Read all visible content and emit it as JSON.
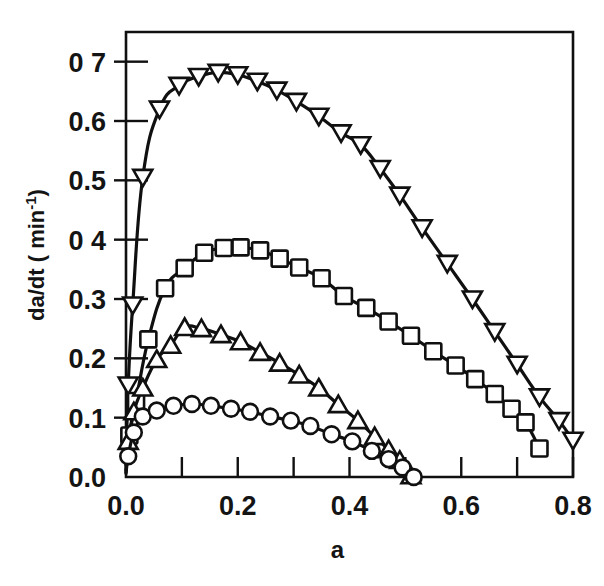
{
  "figure": {
    "background_color": "#ffffff",
    "ink_color": "#101010",
    "x_axis_label": "a",
    "y_axis_label": "da/dt ( min",
    "y_axis_label_sup": "-1",
    "y_axis_label_tail": ")"
  },
  "chart_data": {
    "type": "line",
    "title": "",
    "xlabel": "a",
    "ylabel": "da/dt ( min-1)",
    "xlim": [
      0.0,
      0.8
    ],
    "ylim": [
      0.0,
      0.75
    ],
    "grid": false,
    "legend": "none",
    "xticks": [
      0.0,
      0.1,
      0.2,
      0.3,
      0.4,
      0.5,
      0.6,
      0.7,
      0.8
    ],
    "xtick_labels": [
      "0.0",
      "",
      "0.2",
      "",
      "0.4",
      "",
      "0.6",
      "",
      "0.8"
    ],
    "yticks": [
      0.0,
      0.1,
      0.2,
      0.3,
      0.4,
      0.5,
      0.6,
      0.7
    ],
    "ytick_labels": [
      "0.0",
      "0.1",
      "0.2",
      "0.3",
      "0 4",
      "0.5",
      "0.6",
      "0 7"
    ],
    "series": [
      {
        "name": "series-triangle-down",
        "marker": "triangle-down",
        "x": [
          0.0,
          0.004,
          0.012,
          0.03,
          0.06,
          0.095,
          0.13,
          0.165,
          0.2,
          0.235,
          0.27,
          0.305,
          0.345,
          0.385,
          0.42,
          0.455,
          0.49,
          0.53,
          0.575,
          0.62,
          0.66,
          0.7,
          0.74,
          0.775,
          0.8
        ],
        "y": [
          0.02,
          0.155,
          0.29,
          0.505,
          0.62,
          0.66,
          0.675,
          0.682,
          0.678,
          0.667,
          0.652,
          0.633,
          0.608,
          0.58,
          0.56,
          0.52,
          0.475,
          0.42,
          0.36,
          0.3,
          0.245,
          0.19,
          0.135,
          0.095,
          0.062
        ]
      },
      {
        "name": "series-square",
        "marker": "square",
        "x": [
          0.0,
          0.006,
          0.018,
          0.04,
          0.07,
          0.105,
          0.14,
          0.175,
          0.205,
          0.24,
          0.275,
          0.31,
          0.35,
          0.39,
          0.43,
          0.47,
          0.51,
          0.55,
          0.59,
          0.625,
          0.66,
          0.69,
          0.715,
          0.74
        ],
        "y": [
          0.012,
          0.07,
          0.128,
          0.232,
          0.318,
          0.352,
          0.378,
          0.386,
          0.387,
          0.382,
          0.368,
          0.353,
          0.335,
          0.305,
          0.285,
          0.262,
          0.238,
          0.212,
          0.188,
          0.165,
          0.14,
          0.115,
          0.092,
          0.048
        ]
      },
      {
        "name": "series-triangle-up",
        "marker": "triangle-up",
        "x": [
          0.0,
          0.004,
          0.014,
          0.03,
          0.055,
          0.08,
          0.105,
          0.135,
          0.17,
          0.205,
          0.24,
          0.275,
          0.31,
          0.345,
          0.38,
          0.415,
          0.445,
          0.47,
          0.49,
          0.51
        ],
        "y": [
          0.008,
          0.06,
          0.11,
          0.15,
          0.198,
          0.222,
          0.252,
          0.25,
          0.24,
          0.228,
          0.21,
          0.192,
          0.172,
          0.15,
          0.122,
          0.095,
          0.068,
          0.046,
          0.028,
          0.002
        ]
      },
      {
        "name": "series-circle",
        "marker": "circle",
        "x": [
          0.0,
          0.004,
          0.014,
          0.03,
          0.055,
          0.085,
          0.118,
          0.152,
          0.188,
          0.222,
          0.258,
          0.295,
          0.33,
          0.368,
          0.405,
          0.44,
          0.47,
          0.495,
          0.515
        ],
        "y": [
          0.006,
          0.035,
          0.075,
          0.102,
          0.112,
          0.12,
          0.123,
          0.12,
          0.115,
          0.11,
          0.102,
          0.095,
          0.086,
          0.072,
          0.06,
          0.044,
          0.03,
          0.016,
          0.0
        ]
      }
    ]
  }
}
